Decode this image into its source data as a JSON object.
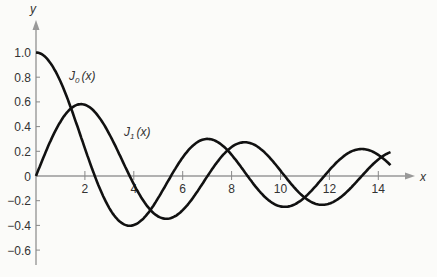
{
  "chart_data": {
    "type": "line",
    "title": "",
    "xlabel": "x",
    "ylabel": "y",
    "xlim": [
      0,
      15
    ],
    "ylim": [
      -0.65,
      1.1
    ],
    "x_ticks": [
      2,
      4,
      6,
      8,
      10,
      12,
      14
    ],
    "x_tick_labels": [
      "2",
      "4",
      "6",
      "8",
      "10",
      "12",
      "14"
    ],
    "y_ticks": [
      1.0,
      0.8,
      0.6,
      0.4,
      0.2,
      0,
      -0.2,
      -0.4,
      -0.6
    ],
    "y_tick_labels": [
      "1.0",
      "0.8",
      "0.6",
      "0.4",
      "0.2",
      "0",
      "-0.2",
      "-0.4",
      "-0.6"
    ],
    "grid": false,
    "legend": "inline labels",
    "series": [
      {
        "name": "J0(x)",
        "label_sub": "0",
        "x": [
          0,
          1,
          2,
          2.405,
          3,
          3.832,
          4,
          5,
          5.52,
          6,
          7,
          7.016,
          8,
          8.654,
          9,
          10,
          10.17,
          11,
          11.79,
          12,
          13,
          13.32,
          14,
          14.5
        ],
        "values": [
          1.0,
          0.765,
          0.224,
          0,
          -0.26,
          -0.403,
          -0.397,
          -0.178,
          0,
          0.151,
          0.3,
          0.3,
          0.172,
          0,
          -0.09,
          -0.246,
          -0.25,
          -0.171,
          0,
          0.048,
          0.207,
          0.218,
          0.171,
          0.11
        ]
      },
      {
        "name": "J1(x)",
        "label_sub": "1",
        "x": [
          0,
          1,
          1.841,
          2,
          3,
          3.832,
          4,
          5,
          5.331,
          6,
          7,
          7.016,
          8,
          8.536,
          9,
          10,
          10.17,
          11,
          11.71,
          12,
          13,
          13.32,
          14,
          14.5
        ],
        "values": [
          0,
          0.44,
          0.582,
          0.577,
          0.339,
          0,
          -0.066,
          -0.328,
          -0.346,
          -0.277,
          -0.005,
          0,
          0.235,
          0.273,
          0.245,
          0.043,
          0,
          -0.177,
          -0.232,
          -0.223,
          -0.07,
          0,
          0.133,
          0.185
        ]
      }
    ],
    "annotations": [
      {
        "text": "J0(x)",
        "near": [
          1.4,
          0.8
        ]
      },
      {
        "text": "J1(x)",
        "near": [
          4.7,
          0.28
        ]
      }
    ]
  },
  "labels": {
    "y_axis": "y",
    "x_axis": "x",
    "j0_main": "J",
    "j0_sub": "0",
    "j0_arg": "(x)",
    "j1_main": "J",
    "j1_sub": "1",
    "j1_arg": "(x)"
  }
}
